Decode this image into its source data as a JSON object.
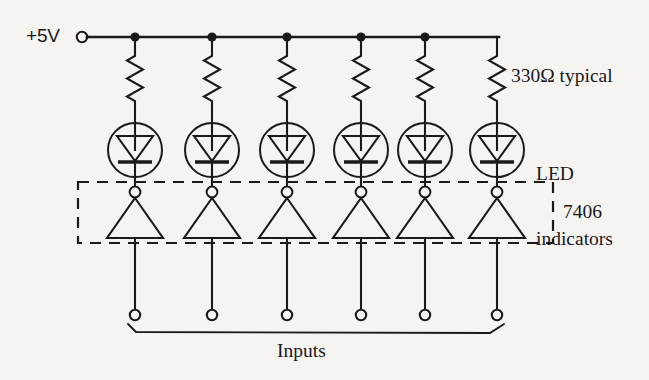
{
  "figure": {
    "background_color": "#f6f4f0",
    "ink_color": "#1a1a18",
    "width": 649,
    "height": 380
  },
  "labels": {
    "supply": "+5V",
    "resistor": "330Ω typical",
    "led_line1": "LED",
    "led_line2": "indicators",
    "ic": "7406",
    "inputs": "Inputs"
  },
  "circuit": {
    "channel_count": 6,
    "supply_rail": {
      "label": "+5V",
      "terminal_type": "open-circle",
      "junction_dot_count": 5
    },
    "resistors": {
      "value": "330Ω typical",
      "symbol": "zigzag",
      "count": 6
    },
    "leds": {
      "label": "LED indicators",
      "symbol": "circled-diode",
      "count": 6
    },
    "inverters": {
      "part": "7406",
      "symbol": "triangle-with-bubble",
      "orientation": "apex-up",
      "count": 6,
      "enclosure": "dashed-box"
    },
    "inputs": {
      "label": "Inputs",
      "terminal_type": "open-circle",
      "count": 6,
      "bracket": "brace"
    }
  },
  "geometry": {
    "columns_x": [
      135,
      212,
      287,
      361,
      425,
      497
    ],
    "rail_y": 37,
    "supply_terminal_x": 82,
    "resistor_top_y": 48,
    "resistor_bottom_y": 102,
    "led_center_y": 150,
    "led_radius": 27,
    "bubble_y": 192,
    "triangle_top_y": 199,
    "triangle_base_y": 238,
    "dashbox": {
      "x": 78,
      "y": 182,
      "width": 475,
      "height": 61
    },
    "input_terminal_y": 315,
    "brace_y": 330
  }
}
